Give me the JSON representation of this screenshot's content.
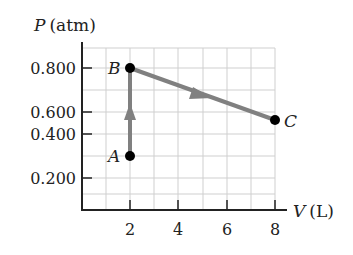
{
  "diagram": {
    "type": "pv-diagram",
    "y_axis": {
      "label_var": "P",
      "label_unit": "(atm)",
      "ticks": [
        "0.200",
        "0.400",
        "0.600",
        "0.800"
      ]
    },
    "x_axis": {
      "label_var": "V",
      "label_unit": "(L)",
      "ticks": [
        "2",
        "4",
        "6",
        "8"
      ]
    },
    "points": [
      {
        "label": "A",
        "V": 2,
        "P": 0.3
      },
      {
        "label": "B",
        "V": 2,
        "P": 0.8
      },
      {
        "label": "C",
        "V": 8,
        "P": 0.5
      }
    ],
    "paths": [
      {
        "from": "A",
        "to": "B",
        "direction": "up"
      },
      {
        "from": "B",
        "to": "C",
        "direction": "right-down"
      }
    ],
    "colors": {
      "path": "#808080",
      "grid": "#cfcfcf",
      "axis": "#222222",
      "point": "#000000"
    }
  }
}
